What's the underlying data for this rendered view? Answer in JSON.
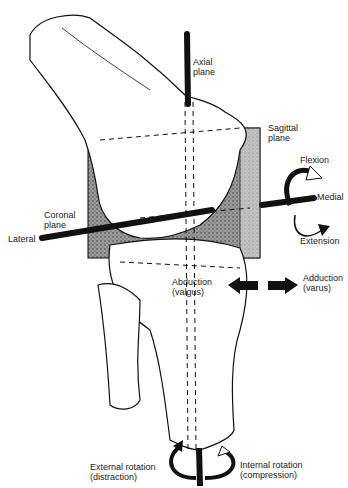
{
  "diagram": {
    "labels": {
      "axial_plane": "Axial\nplane",
      "sagittal_plane": "Sagittal\nplane",
      "coronal_plane": "Coronal\nplane",
      "lateral": "Lateral",
      "medial": "Medial",
      "flexion": "Flexion",
      "extension": "Extension",
      "abduction": "Abduction\n(valgus)",
      "adduction": "Adduction\n(varus)",
      "external_rotation": "External rotation\n(distraction)",
      "internal_rotation": "Internal rotation\n(compression)"
    },
    "colors": {
      "ink": "#111111",
      "plane_fill": "#8a8a8a",
      "background": "#ffffff"
    }
  }
}
